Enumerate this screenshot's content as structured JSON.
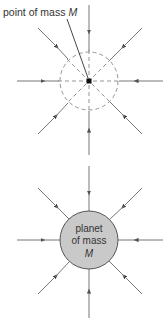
{
  "diagram": {
    "top": {
      "label_text": "point of mass ",
      "label_symbol": "M",
      "center": [
        89,
        81
      ],
      "dashed_circle_radius": 29
    },
    "bottom": {
      "planet_line1": "planet",
      "planet_line2": "of mass",
      "planet_symbol": "M",
      "center": [
        89,
        240
      ],
      "planet_radius": 29
    },
    "colors": {
      "line": "#777777",
      "arrow": "#333333",
      "planet_fill": "#c9c9c9",
      "planet_stroke": "#555555",
      "dash": "#888888"
    }
  }
}
